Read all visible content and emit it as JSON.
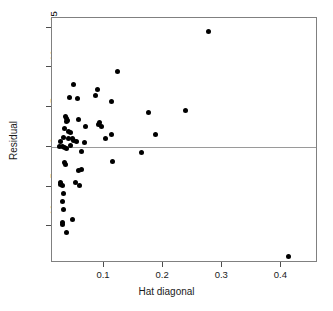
{
  "chart_data": {
    "type": "scatter",
    "title": "",
    "xlabel": "Hat diagonal",
    "ylabel": "Residual",
    "xlim": [
      0.012,
      0.462
    ],
    "ylim": [
      -14.6,
      16.2
    ],
    "xticks": [
      0.1,
      0.2,
      0.3,
      0.4
    ],
    "xtick_labels": [
      "0.1",
      "0.2",
      "0.3",
      "0.4"
    ],
    "yticks": [
      15,
      10,
      5,
      0,
      -5,
      -10
    ],
    "ytick_labels": [
      "15",
      "10",
      "5",
      "0",
      "-5",
      "-10"
    ],
    "grid": false,
    "legend": null,
    "reference_lines": [
      {
        "axis": "y",
        "value": 0,
        "color": "#9a9a9a"
      }
    ],
    "marker": {
      "shape": "circle",
      "filled": true,
      "color": "#000000",
      "size": 5
    },
    "points": [
      {
        "x": 0.277,
        "y": 14.5
      },
      {
        "x": 0.122,
        "y": 9.5
      },
      {
        "x": 0.048,
        "y": 7.9
      },
      {
        "x": 0.089,
        "y": 7.2
      },
      {
        "x": 0.041,
        "y": 6.2
      },
      {
        "x": 0.055,
        "y": 6.1
      },
      {
        "x": 0.086,
        "y": 6.4
      },
      {
        "x": 0.113,
        "y": 5.7
      },
      {
        "x": 0.238,
        "y": 4.6
      },
      {
        "x": 0.176,
        "y": 4.3
      },
      {
        "x": 0.035,
        "y": 3.8
      },
      {
        "x": 0.037,
        "y": 3.6
      },
      {
        "x": 0.038,
        "y": 3.3
      },
      {
        "x": 0.036,
        "y": 3.2
      },
      {
        "x": 0.057,
        "y": 3.5
      },
      {
        "x": 0.069,
        "y": 2.6
      },
      {
        "x": 0.091,
        "y": 2.8
      },
      {
        "x": 0.095,
        "y": 2.5
      },
      {
        "x": 0.093,
        "y": 3.1
      },
      {
        "x": 0.033,
        "y": 2.3
      },
      {
        "x": 0.04,
        "y": 1.9
      },
      {
        "x": 0.044,
        "y": 1.8
      },
      {
        "x": 0.031,
        "y": 1.2
      },
      {
        "x": 0.04,
        "y": 1.1
      },
      {
        "x": 0.046,
        "y": 1.0
      },
      {
        "x": 0.048,
        "y": 0.8
      },
      {
        "x": 0.053,
        "y": 0.7
      },
      {
        "x": 0.067,
        "y": 0.6
      },
      {
        "x": 0.102,
        "y": 1.0
      },
      {
        "x": 0.113,
        "y": 1.5
      },
      {
        "x": 0.187,
        "y": 1.5
      },
      {
        "x": 0.026,
        "y": 0.7
      },
      {
        "x": 0.025,
        "y": 0.1
      },
      {
        "x": 0.03,
        "y": 0.0
      },
      {
        "x": 0.033,
        "y": -0.1
      },
      {
        "x": 0.036,
        "y": -0.2
      },
      {
        "x": 0.044,
        "y": 0.2
      },
      {
        "x": 0.062,
        "y": -0.6
      },
      {
        "x": 0.163,
        "y": -0.7
      },
      {
        "x": 0.115,
        "y": -1.8
      },
      {
        "x": 0.033,
        "y": -2.0
      },
      {
        "x": 0.034,
        "y": -2.2
      },
      {
        "x": 0.057,
        "y": -3.0
      },
      {
        "x": 0.062,
        "y": -2.9
      },
      {
        "x": 0.026,
        "y": -4.5
      },
      {
        "x": 0.027,
        "y": -4.7
      },
      {
        "x": 0.029,
        "y": -4.8
      },
      {
        "x": 0.051,
        "y": -4.5
      },
      {
        "x": 0.058,
        "y": -4.8
      },
      {
        "x": 0.031,
        "y": -5.9
      },
      {
        "x": 0.03,
        "y": -6.9
      },
      {
        "x": 0.032,
        "y": -7.9
      },
      {
        "x": 0.047,
        "y": -9.1
      },
      {
        "x": 0.029,
        "y": -9.5
      },
      {
        "x": 0.03,
        "y": -9.8
      },
      {
        "x": 0.036,
        "y": -10.8
      },
      {
        "x": 0.412,
        "y": -13.8
      }
    ]
  }
}
